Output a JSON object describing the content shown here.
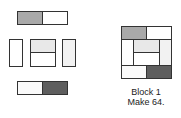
{
  "colors": {
    "medium_gray": "#a9a9a9",
    "dark_gray": "#5e5e5e",
    "light_gray": "#e8e8e8",
    "white": "#ffffff",
    "outline": "#333333"
  },
  "caption": {
    "line1": "Block 1",
    "line2": "Make 64."
  }
}
